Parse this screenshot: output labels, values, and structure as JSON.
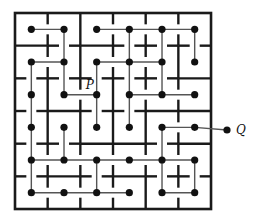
{
  "figure": {
    "type": "maze-grid-path-diagram",
    "grid": {
      "cols": 6,
      "rows": 6,
      "left": 15,
      "top": 13,
      "cell": 32.67
    },
    "colors": {
      "wall": "#1a1a1a",
      "path": "#555555",
      "dot": "#111111",
      "background": "#ffffff"
    },
    "labels": [
      {
        "text": "P",
        "node": [
          2,
          2
        ],
        "dx": -11,
        "dy": -6
      },
      {
        "text": "Q",
        "node": "Q",
        "dx": 9,
        "dy": 4
      }
    ],
    "extra_nodes": {
      "Q": {
        "x": 227,
        "y": 130
      }
    },
    "path_edges": [
      [
        [
          0,
          0
        ],
        [
          1,
          0
        ]
      ],
      [
        [
          2,
          0
        ],
        [
          3,
          0
        ]
      ],
      [
        [
          3,
          0
        ],
        [
          4,
          0
        ]
      ],
      [
        [
          4,
          0
        ],
        [
          5,
          0
        ]
      ],
      [
        [
          0,
          1
        ],
        [
          1,
          1
        ]
      ],
      [
        [
          2,
          1
        ],
        [
          3,
          1
        ]
      ],
      [
        [
          3,
          1
        ],
        [
          4,
          1
        ]
      ],
      [
        [
          1,
          2
        ],
        [
          2,
          2
        ]
      ],
      [
        [
          3,
          2
        ],
        [
          4,
          2
        ]
      ],
      [
        [
          4,
          2
        ],
        [
          5,
          2
        ]
      ],
      [
        [
          4,
          3
        ],
        [
          5,
          3
        ]
      ],
      [
        [
          5,
          3
        ],
        "Q"
      ],
      [
        [
          0,
          4
        ],
        [
          1,
          4
        ]
      ],
      [
        [
          1,
          4
        ],
        [
          2,
          4
        ]
      ],
      [
        [
          2,
          4
        ],
        [
          3,
          4
        ]
      ],
      [
        [
          3,
          4
        ],
        [
          4,
          4
        ]
      ],
      [
        [
          4,
          4
        ],
        [
          5,
          4
        ]
      ],
      [
        [
          0,
          5
        ],
        [
          1,
          5
        ]
      ],
      [
        [
          1,
          5
        ],
        [
          2,
          5
        ]
      ],
      [
        [
          2,
          5
        ],
        [
          3,
          5
        ]
      ],
      [
        [
          4,
          5
        ],
        [
          5,
          5
        ]
      ],
      [
        [
          1,
          0
        ],
        [
          1,
          1
        ]
      ],
      [
        [
          5,
          0
        ],
        [
          5,
          1
        ]
      ],
      [
        [
          3,
          0
        ],
        [
          3,
          1
        ]
      ],
      [
        [
          3,
          1
        ],
        [
          3,
          2
        ]
      ],
      [
        [
          4,
          0
        ],
        [
          4,
          1
        ]
      ],
      [
        [
          4,
          1
        ],
        [
          4,
          2
        ]
      ],
      [
        [
          2,
          1
        ],
        [
          2,
          2
        ]
      ],
      [
        [
          0,
          1
        ],
        [
          0,
          2
        ]
      ],
      [
        [
          1,
          1
        ],
        [
          1,
          2
        ]
      ],
      [
        [
          0,
          2
        ],
        [
          0,
          3
        ]
      ],
      [
        [
          0,
          3
        ],
        [
          0,
          4
        ]
      ],
      [
        [
          0,
          4
        ],
        [
          0,
          5
        ]
      ],
      [
        [
          2,
          2
        ],
        [
          2,
          3
        ]
      ],
      [
        [
          3,
          2
        ],
        [
          3,
          3
        ]
      ],
      [
        [
          1,
          3
        ],
        [
          1,
          4
        ]
      ],
      [
        [
          2,
          4
        ],
        [
          2,
          5
        ]
      ],
      [
        [
          4,
          3
        ],
        [
          4,
          4
        ]
      ],
      [
        [
          4,
          4
        ],
        [
          4,
          5
        ]
      ],
      [
        [
          5,
          4
        ],
        [
          5,
          5
        ]
      ]
    ]
  }
}
